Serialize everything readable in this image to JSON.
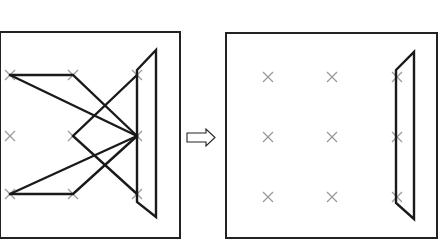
{
  "diagram": {
    "colors": {
      "stroke": "#1a1a1a",
      "grid_marker": "#9a9a9a",
      "background": "#ffffff"
    },
    "left_panel": {
      "box": {
        "x": 0,
        "y": 32,
        "w": 180,
        "h": 206
      },
      "grid_points": [
        [
          10,
          75
        ],
        [
          73,
          75
        ],
        [
          137,
          75
        ],
        [
          10,
          136
        ],
        [
          73,
          136
        ],
        [
          137,
          136
        ],
        [
          10,
          194
        ],
        [
          73,
          194
        ],
        [
          137,
          194
        ]
      ],
      "edges": [
        [
          [
            10,
            75
          ],
          [
            73,
            75
          ],
          [
            137,
            136
          ]
        ],
        [
          [
            10,
            75
          ],
          [
            137,
            136
          ]
        ],
        [
          [
            10,
            194
          ],
          [
            73,
            194
          ],
          [
            137,
            136
          ]
        ],
        [
          [
            10,
            194
          ],
          [
            137,
            136
          ]
        ],
        [
          [
            137,
            75
          ],
          [
            73,
            136
          ],
          [
            137,
            194
          ]
        ]
      ],
      "trapezoid": [
        [
          137,
          70
        ],
        [
          156,
          50
        ],
        [
          156,
          217
        ],
        [
          137,
          202
        ]
      ]
    },
    "arrow": {
      "direction": "right",
      "glyph": "⇨"
    },
    "right_panel": {
      "box": {
        "x": 226,
        "y": 33,
        "w": 211,
        "h": 205
      },
      "grid_points": [
        [
          268,
          77
        ],
        [
          332,
          77
        ],
        [
          397,
          77
        ],
        [
          268,
          137
        ],
        [
          332,
          137
        ],
        [
          397,
          137
        ],
        [
          268,
          197
        ],
        [
          332,
          197
        ],
        [
          397,
          197
        ]
      ],
      "trapezoid": [
        [
          396,
          70
        ],
        [
          414,
          52
        ],
        [
          414,
          219
        ],
        [
          396,
          203
        ]
      ]
    }
  }
}
